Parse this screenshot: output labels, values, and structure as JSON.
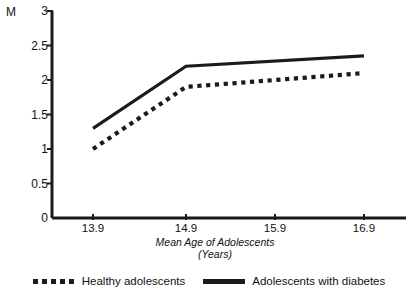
{
  "chart_data": {
    "type": "line",
    "title": "",
    "subtitle": "",
    "xlabel": "Mean Age of Adolescents",
    "xlabel_line2": "(Years)",
    "ylabel": "M",
    "x": [
      13.9,
      14.9,
      16.9
    ],
    "categories": [
      "13.9",
      "14.9",
      "15.9",
      "16.9"
    ],
    "xlim": [
      13.9,
      16.9
    ],
    "ylim": [
      0,
      3
    ],
    "grid": false,
    "legend_position": "bottom",
    "x_tick_labels": [
      "13.9",
      "14.9",
      "15.9",
      "16.9"
    ],
    "y_tick_labels": [
      "3",
      "2.5",
      "2",
      "1.5",
      "1",
      "0.5",
      "0"
    ],
    "y_tick_values": [
      3,
      2.5,
      2,
      1.5,
      1,
      0.5,
      0
    ],
    "series": [
      {
        "name": "Healthy adolescents",
        "style": "dotted",
        "color": "#1b1b1b",
        "x": [
          13.9,
          14.9,
          16.9
        ],
        "values": [
          1.0,
          1.9,
          2.1
        ]
      },
      {
        "name": "Adolescents with diabetes",
        "style": "solid",
        "color": "#1b1b1b",
        "x": [
          13.9,
          14.9,
          16.9
        ],
        "values": [
          1.3,
          2.2,
          2.35
        ]
      }
    ]
  },
  "axis": {
    "y_unit_label": "M",
    "y_ticks": [
      "3",
      "2.5",
      "2",
      "1.5",
      "1",
      "0.5",
      "0"
    ],
    "x_ticks": [
      "13.9",
      "14.9",
      "15.9",
      "16.9"
    ],
    "x_title_line1": "Mean Age of Adolescents",
    "x_title_line2": "(Years)"
  },
  "legend": {
    "entries": [
      {
        "label": "Healthy adolescents",
        "style": "dotted"
      },
      {
        "label": "Adolescents with diabetes",
        "style": "solid"
      }
    ]
  },
  "colors": {
    "ink": "#1b1b1b",
    "background": "#ffffff"
  }
}
